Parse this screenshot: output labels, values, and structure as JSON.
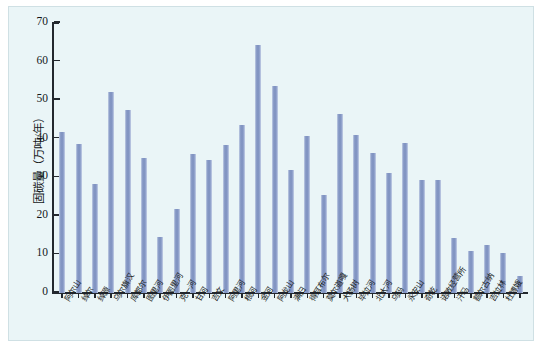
{
  "chart_data": {
    "type": "bar",
    "title": "",
    "xlabel": "",
    "ylabel": "固碳量（万吨/年）",
    "ylim": [
      0,
      70
    ],
    "ytick_labels": [
      "70",
      "60",
      "50",
      "40",
      "30",
      "20",
      "10",
      "0"
    ],
    "ytick_values": [
      70,
      60,
      50,
      40,
      30,
      20,
      10,
      0
    ],
    "grid": false,
    "legend": "none",
    "bar_color": "#8296c4",
    "plot_background": "#eaf5f7",
    "categories": [
      "阿尔山",
      "绰尔",
      "绰源",
      "乌尔旗汉",
      "库都尔",
      "图里河",
      "伊图里河",
      "克一河",
      "甘河",
      "吉文",
      "阿里河",
      "根河",
      "金河",
      "阿龙山",
      "满归",
      "得耳布尔",
      "莫尔道嘎",
      "大杨树",
      "毕拉河",
      "北大河",
      "乌玛",
      "永安山",
      "奇乾",
      "诺敏经营所",
      "汗马",
      "额尔古纳",
      "吉拉林",
      "杜博娥"
    ],
    "values": [
      41.8,
      38.7,
      28.3,
      52.2,
      47.5,
      35.1,
      14.5,
      21.8,
      36.0,
      34.5,
      38.5,
      43.5,
      64.4,
      53.6,
      32.0,
      40.7,
      25.5,
      46.5,
      41.0,
      36.4,
      31.0,
      39.0,
      29.3,
      29.4,
      14.3,
      11.0,
      12.5,
      10.3
    ],
    "extra_value": 4.5,
    "value_count": 29,
    "all_values": [
      41.8,
      38.7,
      28.3,
      52.2,
      47.5,
      35.1,
      14.5,
      21.8,
      36.0,
      34.5,
      38.5,
      43.5,
      64.4,
      53.6,
      32.0,
      40.7,
      25.5,
      46.5,
      41.0,
      36.4,
      31.0,
      39.0,
      29.3,
      29.4,
      14.3,
      11.0,
      12.5,
      10.3,
      4.5
    ]
  }
}
